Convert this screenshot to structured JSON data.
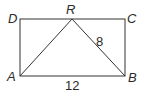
{
  "diagram": {
    "type": "geometry",
    "shape": "rectangle ABCD with triangle ARB, R on side DC",
    "points": {
      "A": {
        "label": "A",
        "x": 20,
        "y": 76
      },
      "B": {
        "label": "B",
        "x": 125,
        "y": 76
      },
      "C": {
        "label": "C",
        "x": 125,
        "y": 19
      },
      "D": {
        "label": "D",
        "x": 20,
        "y": 19
      },
      "R": {
        "label": "R",
        "x": 72,
        "y": 19
      }
    },
    "segments": [
      "AB",
      "BC",
      "CD",
      "DA",
      "AR",
      "RB"
    ],
    "measurements": {
      "RB": "8",
      "AB": "12"
    },
    "colors": {
      "line": "#333333",
      "text": "#2a2a2a",
      "background": "#ffffff"
    }
  }
}
